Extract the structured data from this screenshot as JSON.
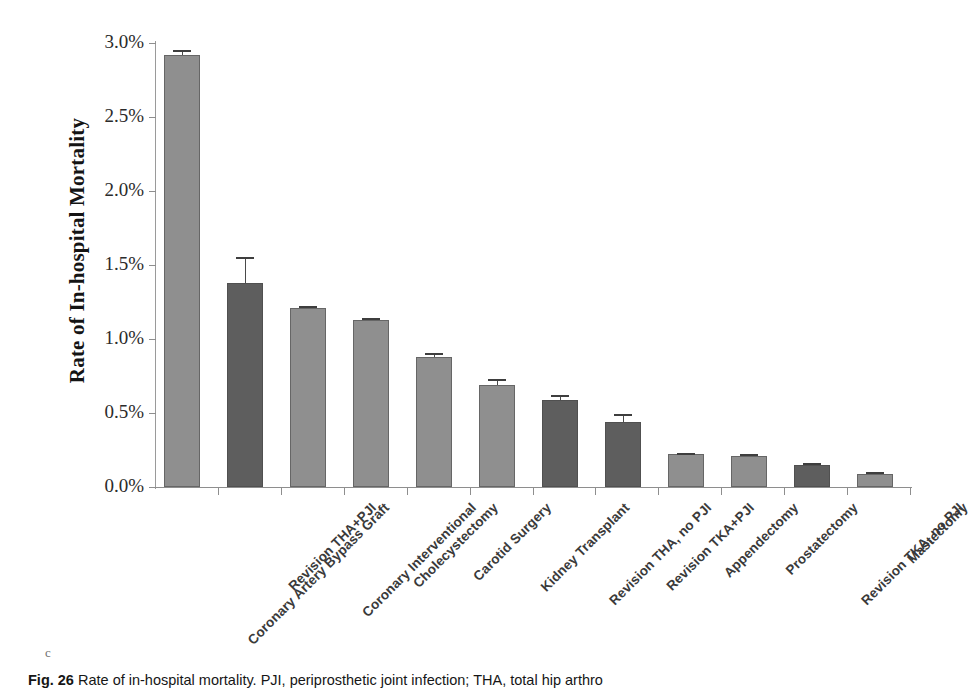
{
  "figure": {
    "caption_number": "Fig. 26",
    "caption_text": "Rate of in-hospital mortality. PJI, periprosthetic joint infection; THA, total hip arthro",
    "stray_mark": "c"
  },
  "chart_data": {
    "type": "bar",
    "title": "",
    "xlabel": "",
    "ylabel": "Rate of In-hospital Mortality",
    "ylim": [
      0.0,
      3.0
    ],
    "ytick_values": [
      0.0,
      0.5,
      1.0,
      1.5,
      2.0,
      2.5,
      3.0
    ],
    "ytick_labels": [
      "0.0%",
      "0.5%",
      "1.0%",
      "1.5%",
      "2.0%",
      "2.5%",
      "3.0%"
    ],
    "grid": false,
    "legend": "none",
    "units": "percent",
    "categories": [
      "Coronary Artery Bypass Graft",
      "Revision THA+PJI",
      "Coronary Interventional",
      "Cholecystectomy",
      "Carotid Surgery",
      "Kidney Transplant",
      "Revision THA, no PJI",
      "Revision TKA+PJI",
      "Appendectomy",
      "Prostatectomy",
      "Revision TKA, no PJI",
      "Mastectomy"
    ],
    "values": [
      2.92,
      1.38,
      1.21,
      1.13,
      0.88,
      0.69,
      0.59,
      0.44,
      0.22,
      0.21,
      0.15,
      0.09
    ],
    "errors": [
      0.035,
      0.175,
      0.015,
      0.015,
      0.025,
      0.04,
      0.03,
      0.055,
      0.012,
      0.012,
      0.012,
      0.008
    ],
    "highlighted": [
      false,
      true,
      false,
      false,
      false,
      false,
      true,
      true,
      false,
      false,
      true,
      false
    ],
    "colors": {
      "bar_standard": "#8f8f8f",
      "bar_highlight": "#5e5e5e",
      "axis": "#8e8e8e",
      "text": "#2b2b2b"
    }
  }
}
